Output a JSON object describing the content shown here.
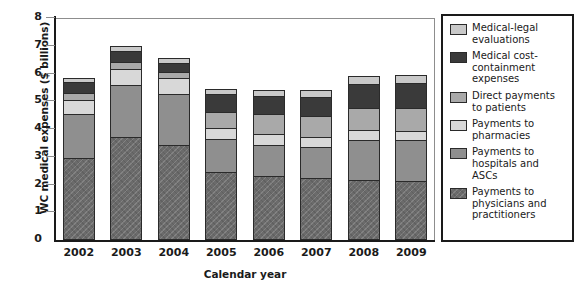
{
  "chart_data": {
    "type": "bar",
    "title": "",
    "subtitle": "",
    "xlabel": "Calendar year",
    "ylabel": "WC medical expenses ($ billions)",
    "categories": [
      "2002",
      "2003",
      "2004",
      "2005",
      "2006",
      "2007",
      "2008",
      "2009"
    ],
    "ylim": [
      0,
      8
    ],
    "yticks": [
      "0",
      "1",
      "2",
      "3",
      "4",
      "5",
      "6",
      "7",
      "8"
    ],
    "grid": false,
    "stacked": true,
    "legend_position": "right",
    "series": [
      {
        "name": "Payments to physicians and practitioners",
        "color": "#6b6b6b",
        "pattern": "hatch",
        "values": [
          2.95,
          3.72,
          3.42,
          2.45,
          2.3,
          2.25,
          2.18,
          2.13
        ]
      },
      {
        "name": "Payments to hospitals and ASCs",
        "color": "#8f8f8f",
        "pattern": "solid",
        "values": [
          1.6,
          1.85,
          1.83,
          1.18,
          1.12,
          1.1,
          1.42,
          1.48
        ]
      },
      {
        "name": "Payments to pharmacies",
        "color": "#d8d8d8",
        "pattern": "solid",
        "values": [
          0.5,
          0.58,
          0.58,
          0.42,
          0.4,
          0.38,
          0.35,
          0.33
        ]
      },
      {
        "name": "Direct payments to patients",
        "color": "#a9a9a9",
        "pattern": "solid",
        "values": [
          0.24,
          0.26,
          0.24,
          0.58,
          0.72,
          0.73,
          0.8,
          0.83
        ]
      },
      {
        "name": "Medical cost-containment expenses",
        "color": "#3a3a3a",
        "pattern": "solid",
        "values": [
          0.42,
          0.42,
          0.32,
          0.62,
          0.66,
          0.68,
          0.88,
          0.9
        ]
      },
      {
        "name": "Medical-legal evaluations",
        "color": "#c9c9c9",
        "pattern": "solid",
        "values": [
          0.14,
          0.17,
          0.17,
          0.18,
          0.2,
          0.26,
          0.27,
          0.29
        ]
      }
    ],
    "totals": [
      5.85,
      7.0,
      6.56,
      5.43,
      5.4,
      5.4,
      5.9,
      5.96
    ]
  },
  "legend": {
    "items": [
      {
        "label": "Medical-legal evaluations",
        "color": "#c9c9c9"
      },
      {
        "label": "Medical cost-containment expenses",
        "color": "#3a3a3a"
      },
      {
        "label": "Direct payments to patients",
        "color": "#a9a9a9"
      },
      {
        "label": "Payments to pharmacies",
        "color": "#d8d8d8"
      },
      {
        "label": "Payments to hospitals and ASCs",
        "color": "#8f8f8f"
      },
      {
        "label": "Payments to physicians and practitioners",
        "color": "#6b6b6b"
      }
    ]
  }
}
